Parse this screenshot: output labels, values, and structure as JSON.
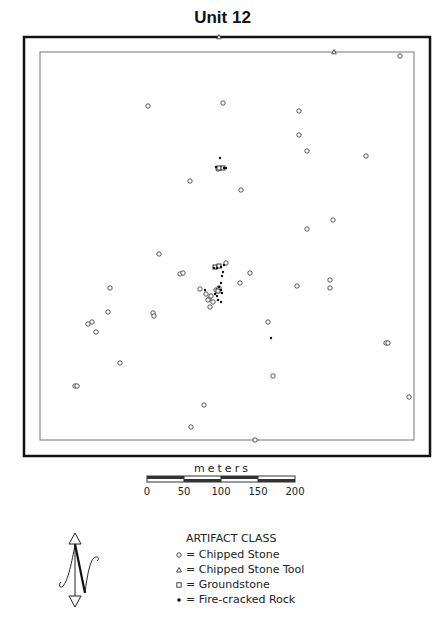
{
  "title": "Unit 12",
  "map": {
    "outer_frame": {
      "x": 24,
      "y": 37,
      "w": 406,
      "h": 419
    },
    "inner_frame": {
      "x": 40,
      "y": 52,
      "w": 374,
      "h": 388
    },
    "symbols": {
      "chipped_stone": [
        [
          148,
          106
        ],
        [
          223,
          103
        ],
        [
          400,
          56
        ],
        [
          299,
          111
        ],
        [
          299,
          135
        ],
        [
          307,
          151
        ],
        [
          366,
          156
        ],
        [
          190,
          181
        ],
        [
          241,
          190
        ],
        [
          333,
          220
        ],
        [
          307,
          229
        ],
        [
          159,
          254
        ],
        [
          180,
          274
        ],
        [
          183,
          273
        ],
        [
          226,
          263
        ],
        [
          240,
          283
        ],
        [
          250,
          273
        ],
        [
          297,
          286
        ],
        [
          330,
          280
        ],
        [
          330,
          288
        ],
        [
          110,
          288
        ],
        [
          108,
          312
        ],
        [
          153,
          313
        ],
        [
          154,
          316
        ],
        [
          92,
          322
        ],
        [
          88,
          324
        ],
        [
          96,
          332
        ],
        [
          268,
          322
        ],
        [
          120,
          363
        ],
        [
          386,
          343
        ],
        [
          388,
          343
        ],
        [
          75,
          386
        ],
        [
          77,
          386
        ],
        [
          273,
          376
        ],
        [
          409,
          397
        ],
        [
          204,
          405
        ],
        [
          191,
          427
        ],
        [
          255,
          440
        ],
        [
          218,
          169
        ],
        [
          206,
          294
        ],
        [
          209,
          299
        ],
        [
          211,
          296
        ],
        [
          213,
          302
        ],
        [
          216,
          290
        ],
        [
          219,
          288
        ],
        [
          210,
          307
        ],
        [
          208,
          300
        ],
        [
          200,
          289
        ]
      ],
      "chipped_stone_tool": [
        [
          219,
          37
        ],
        [
          334,
          52
        ]
      ],
      "groundstone": [
        [
          219,
          168
        ],
        [
          223,
          168
        ],
        [
          215,
          267
        ],
        [
          219,
          266
        ],
        [
          218,
          291
        ]
      ],
      "fire_cracked_rock": [
        [
          220,
          158
        ],
        [
          216,
          167
        ],
        [
          224,
          168
        ],
        [
          226,
          168
        ],
        [
          214,
          268
        ],
        [
          217,
          268
        ],
        [
          221,
          267
        ],
        [
          224,
          265
        ],
        [
          223,
          272
        ],
        [
          222,
          276
        ],
        [
          221,
          283
        ],
        [
          219,
          287
        ],
        [
          221,
          290
        ],
        [
          222,
          293
        ],
        [
          215,
          294
        ],
        [
          217,
          296
        ],
        [
          205,
          290
        ],
        [
          218,
          300
        ],
        [
          221,
          302
        ],
        [
          271,
          338
        ]
      ]
    }
  },
  "scale": {
    "unit_label": "meters",
    "ticks": [
      "0",
      "50",
      "100",
      "150",
      "200"
    ]
  },
  "north_arrow": {
    "label": "N"
  },
  "legend": {
    "title": "ARTIFACT CLASS",
    "items": [
      {
        "symbol": "circle",
        "label": "= Chipped Stone"
      },
      {
        "symbol": "triangle",
        "label": "= Chipped Stone Tool"
      },
      {
        "symbol": "square",
        "label": "= Groundstone"
      },
      {
        "symbol": "dot",
        "label": "= Fire-cracked Rock"
      }
    ]
  }
}
